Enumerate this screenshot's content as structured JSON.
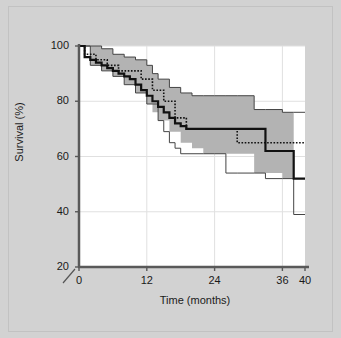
{
  "figure": {
    "background_color": "#d2d2d2",
    "plot_background_color": "#ffffff",
    "band_color": "#b3b3b3",
    "axis_color": "#595959",
    "grid_color": "#e0e0e0",
    "curve_color": "#111111",
    "axis_break_marker": "/"
  },
  "chart_data": {
    "type": "line",
    "title": "",
    "subtitle": "",
    "xlabel": "Time (months)",
    "ylabel": "Survival (%)",
    "xlim": [
      0,
      40
    ],
    "ylim": [
      20,
      100
    ],
    "xticks": [
      0,
      12,
      24,
      36,
      40
    ],
    "xtick_labels": [
      "0",
      "12",
      "24",
      "36",
      "40"
    ],
    "yticks": [
      20,
      40,
      60,
      80,
      100
    ],
    "ytick_labels": [
      "20",
      "40",
      "60",
      "80",
      "100"
    ],
    "grid": true,
    "grid_axis": "both",
    "legend": "none",
    "y_axis_broken": true,
    "annotations": [
      "axis break slash between 20 and 0 at origin"
    ],
    "series": [
      {
        "name": "Kaplan-Meier survival (solid bold)",
        "style": "step-solid-bold",
        "color": "#111111",
        "x": [
          0,
          1,
          2,
          3,
          4,
          5,
          6,
          7,
          8,
          9,
          10,
          11,
          12,
          13,
          14,
          15,
          16,
          17,
          18,
          19,
          20,
          22,
          24,
          26,
          28,
          31,
          33,
          36,
          38,
          40
        ],
        "y": [
          100,
          96,
          95,
          94,
          93,
          92,
          91,
          90,
          89,
          88,
          86,
          84,
          82,
          80,
          78,
          76,
          74,
          72,
          71,
          70,
          70,
          70,
          70,
          70,
          70,
          70,
          62,
          62,
          52,
          52
        ]
      },
      {
        "name": "Comparison survival (dotted)",
        "style": "step-dotted",
        "color": "#111111",
        "x": [
          0,
          1,
          3,
          5,
          7,
          9,
          11,
          13,
          15,
          17,
          19,
          21,
          24,
          28,
          31,
          34,
          37,
          40
        ],
        "y": [
          100,
          97,
          95,
          93,
          91,
          91,
          88,
          84,
          80,
          74,
          70,
          70,
          70,
          65,
          65,
          65,
          65,
          65
        ]
      },
      {
        "name": "Upper 95% confidence limit (thin)",
        "style": "step-thin",
        "color": "#444444",
        "x": [
          0,
          2,
          4,
          6,
          8,
          10,
          12,
          13,
          14,
          16,
          18,
          20,
          22,
          24,
          26,
          28,
          31,
          33,
          36,
          38,
          40
        ],
        "y": [
          100,
          100,
          99,
          97,
          96,
          95,
          93,
          90,
          88,
          85,
          83,
          82,
          82,
          82,
          82,
          82,
          77,
          77,
          76,
          76,
          76
        ]
      },
      {
        "name": "Lower 95% confidence limit (thin)",
        "style": "step-thin",
        "color": "#444444",
        "x": [
          0,
          2,
          4,
          6,
          8,
          10,
          12,
          14,
          15,
          16,
          17,
          18,
          20,
          22,
          24,
          26,
          28,
          31,
          33,
          36,
          38,
          40
        ],
        "y": [
          100,
          93,
          91,
          89,
          86,
          83,
          79,
          73,
          69,
          65,
          63,
          61,
          61,
          61,
          61,
          54,
          54,
          54,
          52,
          52,
          39,
          39
        ]
      }
    ],
    "band": {
      "name": "95% confidence band (shaded)",
      "fill_color": "#b3b3b3",
      "x": [
        0,
        2,
        4,
        6,
        8,
        10,
        12,
        13,
        14,
        16,
        18,
        20,
        22,
        24,
        26,
        28,
        31,
        33,
        36,
        38
      ],
      "upper": [
        100,
        100,
        99,
        97,
        96,
        95,
        93,
        90,
        88,
        85,
        83,
        82,
        82,
        82,
        82,
        82,
        77,
        77,
        76,
        76
      ],
      "lower": [
        100,
        93,
        91,
        89,
        86,
        83,
        79,
        76,
        73,
        69,
        65,
        63,
        61,
        61,
        61,
        61,
        54,
        54,
        52,
        52
      ]
    }
  }
}
